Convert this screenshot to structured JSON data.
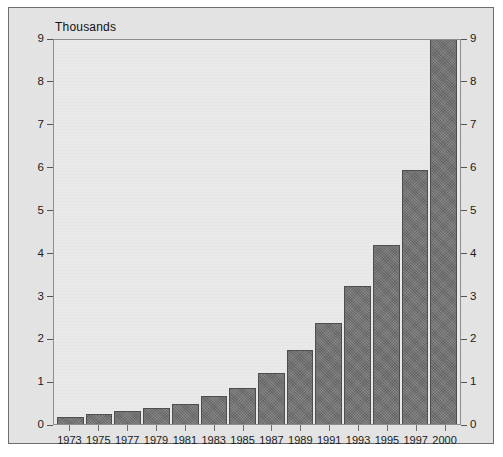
{
  "chart_data": {
    "type": "bar",
    "title": "",
    "subtitle": "",
    "unit_label": "Thousands",
    "xlabel": "",
    "ylabel": "",
    "categories": [
      "1973",
      "1975",
      "1977",
      "1979",
      "1981",
      "1983",
      "1985",
      "1987",
      "1989",
      "1991",
      "1993",
      "1995",
      "1997",
      "2000"
    ],
    "values": [
      0.17,
      0.24,
      0.31,
      0.37,
      0.47,
      0.65,
      0.85,
      1.18,
      1.73,
      2.35,
      3.22,
      4.18,
      5.93,
      9.0
    ],
    "ylim": [
      0,
      9
    ],
    "yticks": [
      0,
      1,
      2,
      3,
      4,
      5,
      6,
      7,
      8,
      9
    ],
    "ytick_labels": [
      "0",
      "1",
      "2",
      "3",
      "4",
      "5",
      "6",
      "7",
      "8",
      "9"
    ],
    "y_axis_both_sides": true,
    "grid": false,
    "legend": null,
    "legend_position": "none",
    "series": [
      {
        "name": "",
        "values": [
          0.17,
          0.24,
          0.31,
          0.37,
          0.47,
          0.65,
          0.85,
          1.18,
          1.73,
          2.35,
          3.22,
          4.18,
          5.93,
          9.0
        ]
      }
    ]
  },
  "colors": {
    "bar_fill": "#6d6d6d",
    "bar_border": "#4e4e4e",
    "plot_background": "#e9e9e9",
    "figure_background": "#e3e3e3",
    "frame_border": "#6e6e6e",
    "axis_line": "#8d8d8d",
    "text": "#1b1b1b"
  }
}
